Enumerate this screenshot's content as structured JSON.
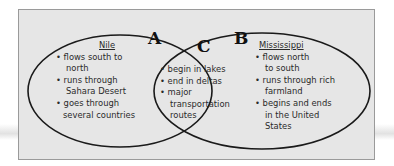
{
  "diagram": {
    "type": "venn",
    "regions": {
      "A": {
        "label": "A",
        "title": "Nile",
        "items": [
          [
            "• flows south to",
            "north"
          ],
          [
            "• runs through",
            "Sahara Desert"
          ],
          [
            "• goes through",
            "several countries"
          ]
        ]
      },
      "C": {
        "label": "C",
        "items": [
          [
            "• begin in lakes"
          ],
          [
            "• end in deltas"
          ],
          [
            "• major",
            "transportation",
            "routes"
          ]
        ]
      },
      "B": {
        "label": "B",
        "title": "Mississippi",
        "items": [
          [
            "• flows north",
            "to south"
          ],
          [
            "• runs through rich",
            "farmland"
          ],
          [
            "• begins and ends",
            "in the United",
            "States"
          ]
        ]
      }
    },
    "colors": {
      "background": "#e6e6e6",
      "outline": "#1a1a1a",
      "text": "#2a2a2a"
    }
  }
}
